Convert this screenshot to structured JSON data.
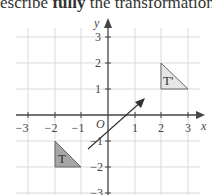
{
  "question": {
    "prefix": "escribe ",
    "bold": "fully",
    "suffix": " the transformation that"
  },
  "graph": {
    "x_axis_label": "x",
    "y_axis_label": "y",
    "origin_label": "O",
    "x_ticks": [
      "−3",
      "−2",
      "−1",
      "1",
      "2",
      "3"
    ],
    "y_ticks": [
      "3",
      "2",
      "1",
      "−1",
      "−2",
      "−3"
    ],
    "shapes": [
      {
        "name": "T",
        "label": "T",
        "vertices": [
          [
            -2,
            -1
          ],
          [
            -2,
            -2
          ],
          [
            -1,
            -2
          ]
        ],
        "fill": "#a6a6a6"
      },
      {
        "name": "T-prime",
        "label": "T'",
        "vertices": [
          [
            2,
            2
          ],
          [
            2,
            1
          ],
          [
            3,
            1
          ]
        ],
        "fill": "#e6e6e6"
      }
    ],
    "arrow": {
      "from": [
        -0.75,
        -1.3
      ],
      "to": [
        1.35,
        0.95
      ]
    }
  }
}
